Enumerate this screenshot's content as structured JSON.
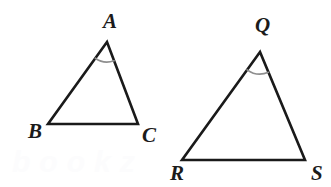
{
  "figure": {
    "background_color": "#ffffff",
    "width": 331,
    "height": 187,
    "stroke_color": "#1a1a1a",
    "arc_color": "#8e8e8e",
    "label_color": "#1b1b1b"
  },
  "triangles": [
    {
      "name": "triangle-abc",
      "vertices": [
        {
          "label": "A",
          "x": 107,
          "y": 42,
          "label_x": 103,
          "label_y": 28
        },
        {
          "label": "B",
          "x": 48,
          "y": 124,
          "label_x": 28,
          "label_y": 138
        },
        {
          "label": "C",
          "x": 138,
          "y": 124,
          "label_x": 142,
          "label_y": 142
        }
      ],
      "angle_mark": {
        "at": "A",
        "radius": 20,
        "style": "single-arc"
      }
    },
    {
      "name": "triangle-qrs",
      "vertices": [
        {
          "label": "Q",
          "x": 260,
          "y": 52,
          "label_x": 255,
          "label_y": 32
        },
        {
          "label": "R",
          "x": 182,
          "y": 160,
          "label_x": 170,
          "label_y": 180
        },
        {
          "label": "S",
          "x": 305,
          "y": 160,
          "label_x": 311,
          "label_y": 180
        }
      ],
      "angle_mark": {
        "at": "Q",
        "radius": 22,
        "style": "single-arc"
      }
    }
  ],
  "watermark": {
    "text": "bookz",
    "x": 12,
    "y": 172,
    "color": "#fcfcfd"
  }
}
